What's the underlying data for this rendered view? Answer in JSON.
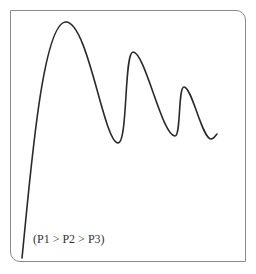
{
  "figure": {
    "label": "(P1 > P2 > P3)",
    "frame_color": "#8a8a8a",
    "curve_color": "#2a2a2a",
    "peaks": [
      {
        "name": "P1",
        "x": 66,
        "y": 22
      },
      {
        "name": "P2",
        "x": 133,
        "y": 52
      },
      {
        "name": "P3",
        "x": 184,
        "y": 87
      }
    ],
    "curve_path": "M22,258 C30,180 42,22 66,22 C88,22 104,143 118,143 C128,143 124,52 133,52 C145,52 162,136 175,136 C181,136 178,87 184,87 C192,87 202,139 211,139 C214,139 216,135 217,134"
  }
}
